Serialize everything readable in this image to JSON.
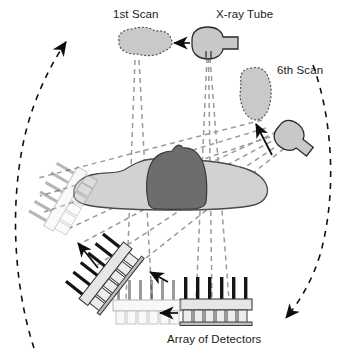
{
  "figure": {
    "title_visible": false,
    "background_color": "#ffffff",
    "type": "ct-scanner-rotation-diagram"
  },
  "labels": {
    "first_scan": "1st Scan",
    "xray_tube": "X-ray Tube",
    "sixth_scan": "6th Scan",
    "array_of_detectors": "Array of Detectors"
  },
  "colors": {
    "body_fill": "#d2d2d2",
    "head_fill": "#6d6d6d",
    "tube_fill": "#c8c8c8",
    "blob_fill": "#c9c9c9",
    "detector_cell": "#e6e6e6",
    "detector_bar": "#1a1a1a",
    "ghost_gray": "#cfcfcf",
    "ray_dash": "#909090",
    "arc_dash": "#111111",
    "outline": "#1a1a1a",
    "text": "#1a1a1a"
  },
  "annotations": {
    "rotation_direction": "counterclockwise",
    "scan_count": 6,
    "arc_arrow_top_left": "rotation-arrow-up",
    "arc_arrow_bottom_right": "rotation-arrow-down"
  },
  "components": {
    "xray_tube_positions": [
      {
        "index": 1,
        "label": "1st Scan",
        "angle_deg": 90
      },
      {
        "index": 6,
        "label": "6th Scan",
        "angle_deg": 45
      }
    ],
    "detector_arrays": [
      {
        "index": 1,
        "state": "active",
        "orientation": "horizontal"
      },
      {
        "index": 2,
        "state": "faded",
        "orientation": "horizontal"
      },
      {
        "index": 3,
        "state": "active",
        "orientation": "rotated"
      },
      {
        "index": 4,
        "state": "ghost",
        "orientation": "rotated"
      }
    ],
    "patient": {
      "body": "torso-cross-section",
      "head": "head-cross-section"
    }
  }
}
